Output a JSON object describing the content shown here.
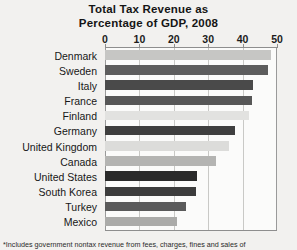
{
  "chart_data": {
    "type": "bar",
    "orientation": "horizontal",
    "title": "Total Tax Revenue as Percentage of GDP, 2008",
    "title_lines": [
      "Total Tax Revenue as",
      "Percentage of GDP, 2008"
    ],
    "xlabel": "",
    "ylabel": "",
    "xlim": [
      0,
      50
    ],
    "xticks": [
      0,
      10,
      20,
      30,
      40,
      50
    ],
    "xtick_labels": [
      "0",
      "10",
      "20",
      "30",
      "40",
      "50"
    ],
    "grid": true,
    "grid_axis": "x",
    "legend": false,
    "categories": [
      "Denmark",
      "Sweden",
      "Italy",
      "France",
      "Finland",
      "Germany",
      "United Kingdom",
      "Canada",
      "United States",
      "South Korea",
      "Turkey",
      "Mexico"
    ],
    "values": [
      48.3,
      47.5,
      43.0,
      42.8,
      42.0,
      37.8,
      36.0,
      32.2,
      26.8,
      26.5,
      23.5,
      21.0
    ],
    "bar_colors": [
      "#c6c6c4",
      "#5d5d5d",
      "#4a4a4a",
      "#575757",
      "#e2e2e0",
      "#3f3f3f",
      "#dcdcda",
      "#b4b4b2",
      "#2a2a2a",
      "#3c3c3c",
      "#5a5a5a",
      "#ababa9"
    ],
    "footnote": "*Includes government nontax revenue from fees, charges, fines and sales of"
  },
  "colors": {
    "background": "#f2f1ef",
    "plot_background": "#fbfbfa",
    "gridline": "#c9c9c6",
    "axis": "#8e8e8e",
    "text": "#1a1a1a"
  }
}
